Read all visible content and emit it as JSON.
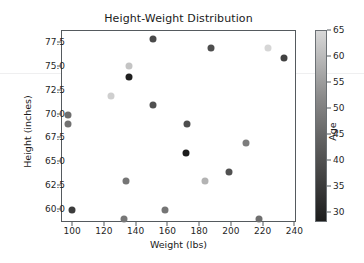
{
  "chart_data": {
    "type": "scatter",
    "title": "Height-Weight Distribution",
    "xlabel": "Weight (lbs)",
    "ylabel": "Height (inches)",
    "xlim": [
      93,
      241
    ],
    "ylim": [
      58.6,
      78.8
    ],
    "xticks": [
      100,
      120,
      140,
      160,
      180,
      200,
      220,
      240
    ],
    "xtick_labels": [
      "100",
      "120",
      "140",
      "160",
      "180",
      "200",
      "220",
      "240"
    ],
    "yticks": [
      60.0,
      62.5,
      65.0,
      67.5,
      70.0,
      72.5,
      75.0,
      77.5
    ],
    "ytick_labels": [
      "60.0",
      "62.5",
      "65.0",
      "67.5",
      "70.0",
      "72.5",
      "75.0",
      "77.5"
    ],
    "grid": false,
    "colorbar": {
      "label": "Age",
      "ticks": [
        30,
        35,
        40,
        45,
        50,
        55,
        60,
        65
      ],
      "tick_labels": [
        "30",
        "35",
        "40",
        "45",
        "50",
        "55",
        "60",
        "65"
      ],
      "vmin": 28,
      "vmax": 65,
      "colormap": "gray",
      "low_color": "#1c1c1c",
      "high_color": "#d8d8d8",
      "position": "right"
    },
    "marker": "circle",
    "marker_size": 7,
    "series_name": "individuals",
    "x": [
      97,
      97,
      99,
      124,
      132,
      133,
      135,
      135,
      150,
      150,
      158,
      171,
      172,
      183,
      187,
      198,
      209,
      217,
      223,
      233
    ],
    "y": [
      70,
      69,
      60,
      72,
      59,
      63,
      75.1,
      74,
      78,
      71,
      60,
      66,
      69,
      63,
      77,
      64,
      67,
      59,
      77,
      76
    ],
    "c": [
      47,
      46,
      33,
      62,
      44,
      45,
      60,
      29,
      36,
      38,
      45,
      28,
      37,
      57,
      37,
      38,
      48,
      44,
      63,
      34
    ],
    "points": [
      {
        "weight": 97,
        "height": 70,
        "age": 47,
        "color": "#6e6e6e"
      },
      {
        "weight": 97,
        "height": 69,
        "age": 46,
        "color": "#727272"
      },
      {
        "weight": 99,
        "height": 60,
        "age": 33,
        "color": "#3c3c3c"
      },
      {
        "weight": 124,
        "height": 72,
        "age": 62,
        "color": "#cfcfcf"
      },
      {
        "weight": 132,
        "height": 59,
        "age": 44,
        "color": "#777777"
      },
      {
        "weight": 133,
        "height": 63,
        "age": 45,
        "color": "#757575"
      },
      {
        "weight": 135,
        "height": 75.1,
        "age": 60,
        "color": "#c4c4c4"
      },
      {
        "weight": 135,
        "height": 74,
        "age": 29,
        "color": "#1f1f1f"
      },
      {
        "weight": 150,
        "height": 78,
        "age": 36,
        "color": "#4a4a4a"
      },
      {
        "weight": 150,
        "height": 71,
        "age": 38,
        "color": "#515151"
      },
      {
        "weight": 158,
        "height": 60,
        "age": 45,
        "color": "#757575"
      },
      {
        "weight": 171,
        "height": 66,
        "age": 28,
        "color": "#1c1c1c"
      },
      {
        "weight": 172,
        "height": 69,
        "age": 37,
        "color": "#4e4e4e"
      },
      {
        "weight": 183,
        "height": 63,
        "age": 57,
        "color": "#b3b3b3"
      },
      {
        "weight": 187,
        "height": 77,
        "age": 37,
        "color": "#4e4e4e"
      },
      {
        "weight": 198,
        "height": 64,
        "age": 38,
        "color": "#515151"
      },
      {
        "weight": 209,
        "height": 67,
        "age": 48,
        "color": "#7d7d7d"
      },
      {
        "weight": 217,
        "height": 59,
        "age": 44,
        "color": "#6f6f6f"
      },
      {
        "weight": 223,
        "height": 77,
        "age": 63,
        "color": "#d6d6d6"
      },
      {
        "weight": 233,
        "height": 76,
        "age": 34,
        "color": "#414141"
      }
    ]
  }
}
